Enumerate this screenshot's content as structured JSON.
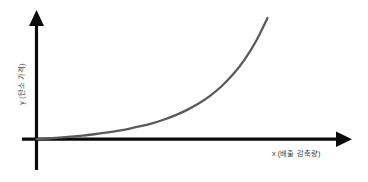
{
  "chart_data": {
    "type": "line",
    "title": "",
    "subtitle": "",
    "xlabel": "x (배출 감축량)",
    "ylabel": "y (탄소 가격)",
    "xlim": [
      0,
      1
    ],
    "ylim": [
      0,
      1
    ],
    "grid": false,
    "legend": null,
    "annotations": [],
    "series": [
      {
        "name": "한계감축비용곡선",
        "color": "#5a5a5a",
        "x": [
          0.0,
          0.05,
          0.1,
          0.15,
          0.2,
          0.25,
          0.3,
          0.35,
          0.4,
          0.45,
          0.5,
          0.55,
          0.6,
          0.65,
          0.7,
          0.75,
          0.8,
          0.85,
          0.9,
          0.95,
          1.0
        ],
        "y": [
          0.0,
          0.005,
          0.011,
          0.018,
          0.026,
          0.035,
          0.046,
          0.059,
          0.074,
          0.092,
          0.113,
          0.138,
          0.169,
          0.206,
          0.251,
          0.306,
          0.374,
          0.458,
          0.563,
          0.695,
          0.86
        ]
      }
    ]
  },
  "axes": {
    "y_axis_label": "y (탄소 가격)",
    "x_axis_label": "x (배출 감축량)",
    "y_arrow_icon": "arrow-up-icon",
    "x_arrow_icon": "arrow-right-icon",
    "axis_color": "#0a0a0a",
    "curve_color": "#5a5a5a",
    "background_color": "#ffffff"
  }
}
